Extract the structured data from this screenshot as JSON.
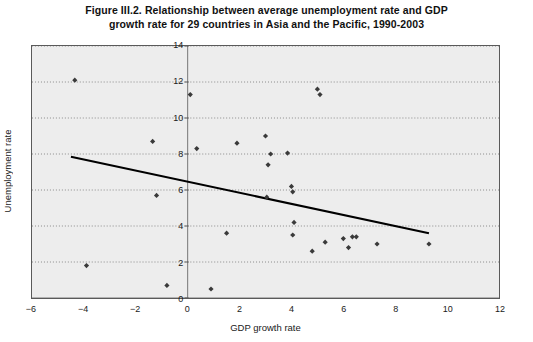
{
  "figure": {
    "title_line1": "Figure III.2. Relationship between average unemployment rate and GDP",
    "title_line2": "growth rate for 29 countries in Asia and the Pacific, 1990-2003"
  },
  "chart_data": {
    "type": "scatter",
    "title": "Figure III.2. Relationship between average unemployment rate and GDP growth rate for 29 countries in Asia and the Pacific, 1990-2003",
    "xlabel": "GDP growth rate",
    "ylabel": "Unemployment rate",
    "xlim": [
      -6,
      12
    ],
    "ylim": [
      0,
      14
    ],
    "xticks": [
      -6,
      -4,
      -2,
      0,
      2,
      4,
      6,
      8,
      10,
      12
    ],
    "xtick_labels": [
      "−6",
      "−4",
      "−2",
      "0",
      "2",
      "4",
      "6",
      "8",
      "10",
      "12"
    ],
    "yticks": [
      0,
      2,
      4,
      6,
      8,
      10,
      12,
      14
    ],
    "ytick_labels": [
      "0",
      "2",
      "4",
      "6",
      "8",
      "10",
      "12",
      "14"
    ],
    "grid": "horizontal-dotted",
    "legend": "none",
    "marker_color": "#3a3a3a",
    "trendline_color": "#000000",
    "plot_background": "#ededed",
    "points": [
      {
        "x": -4.35,
        "y": 12.1
      },
      {
        "x": -1.35,
        "y": 8.7
      },
      {
        "x": -1.2,
        "y": 5.7
      },
      {
        "x": -3.9,
        "y": 1.8
      },
      {
        "x": -0.8,
        "y": 0.7
      },
      {
        "x": 0.1,
        "y": 11.3
      },
      {
        "x": 0.35,
        "y": 8.3
      },
      {
        "x": 1.5,
        "y": 3.6
      },
      {
        "x": 1.9,
        "y": 8.6
      },
      {
        "x": 0.9,
        "y": 0.5
      },
      {
        "x": 3.0,
        "y": 9.0
      },
      {
        "x": 3.2,
        "y": 8.0
      },
      {
        "x": 3.1,
        "y": 7.4
      },
      {
        "x": 3.05,
        "y": 5.6
      },
      {
        "x": 3.85,
        "y": 8.05
      },
      {
        "x": 4.0,
        "y": 6.2
      },
      {
        "x": 4.05,
        "y": 5.9
      },
      {
        "x": 4.1,
        "y": 4.2
      },
      {
        "x": 4.05,
        "y": 3.5
      },
      {
        "x": 5.0,
        "y": 11.6
      },
      {
        "x": 5.1,
        "y": 11.3
      },
      {
        "x": 4.8,
        "y": 2.6
      },
      {
        "x": 5.3,
        "y": 3.1
      },
      {
        "x": 6.0,
        "y": 3.3
      },
      {
        "x": 6.35,
        "y": 3.4
      },
      {
        "x": 6.5,
        "y": 3.4
      },
      {
        "x": 6.2,
        "y": 2.8
      },
      {
        "x": 7.3,
        "y": 3.0
      },
      {
        "x": 9.3,
        "y": 3.0
      }
    ],
    "trendline": {
      "x_start": -4.5,
      "y_start": 7.85,
      "x_end": 9.3,
      "y_end": 3.6
    }
  }
}
